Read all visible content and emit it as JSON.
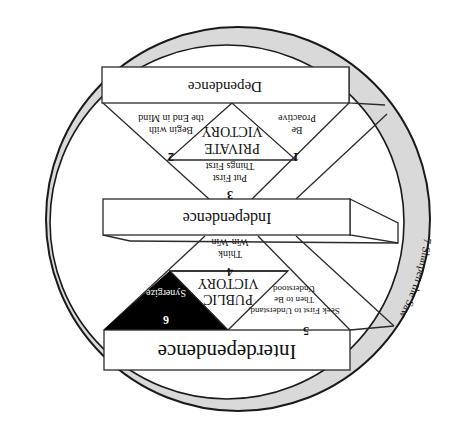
{
  "diagram": {
    "orientation": "rotated-180",
    "colors": {
      "ring_fill": "#d9d9d9",
      "line": "#2a2a2a",
      "synergize_fill": "#000000",
      "background": "#ffffff"
    },
    "stages": {
      "dependence": "Dependence",
      "independence": "Independence",
      "interdependence": "Interdependence"
    },
    "victories": {
      "private_line1": "PRIVATE",
      "private_line2": "VICTORY",
      "public_line1": "PUBLIC",
      "public_line2": "VICTORY"
    },
    "habits": [
      {
        "number": "1",
        "lines": [
          "Be",
          "Proactive"
        ]
      },
      {
        "number": "2",
        "lines": [
          "Begin with",
          "the End in Mind"
        ]
      },
      {
        "number": "3",
        "lines": [
          "Put First",
          "Things First"
        ]
      },
      {
        "number": "4",
        "lines": [
          "Think",
          "Win-Win"
        ]
      },
      {
        "number": "5",
        "lines": [
          "Seek First to Understand,",
          "Then to Be",
          "Understood"
        ]
      },
      {
        "number": "6",
        "lines": [
          "Synergize"
        ]
      },
      {
        "number": "7",
        "lines": [
          "Sharpen the Saw"
        ]
      }
    ],
    "ring_label": "7  Sharpen the Saw"
  }
}
